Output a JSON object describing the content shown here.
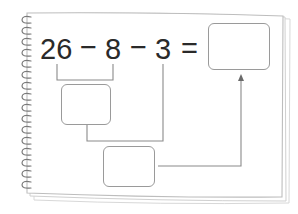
{
  "worksheet": {
    "equation": {
      "terms": [
        "26",
        "−",
        "8",
        "−",
        "3",
        "="
      ],
      "description": "26 - 8 - 3 = ?"
    },
    "boxes": {
      "result": {
        "value": ""
      },
      "step1": {
        "value": ""
      },
      "step2": {
        "value": ""
      }
    },
    "colors": {
      "text": "#2a2a2a",
      "lines": "#8a8a8a",
      "page_border": "#c8c8c8",
      "spiral": "#7a7a7a"
    }
  }
}
